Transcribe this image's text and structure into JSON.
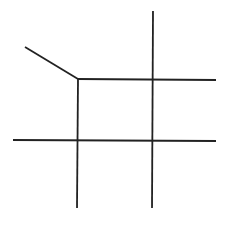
{
  "diagram": {
    "stroke_color": "#222222",
    "stroke_width": 1.8,
    "background": "#ffffff",
    "lines": [
      {
        "id": "diagonal-segment",
        "x1": 25,
        "y1": 47,
        "x2": 78,
        "y2": 79
      },
      {
        "id": "top-horizontal",
        "x1": 78,
        "y1": 79,
        "x2": 216,
        "y2": 80
      },
      {
        "id": "bottom-horizontal",
        "x1": 13,
        "y1": 140,
        "x2": 216,
        "y2": 141
      },
      {
        "id": "left-vertical",
        "x1": 78,
        "y1": 79,
        "x2": 77,
        "y2": 208
      },
      {
        "id": "right-vertical",
        "x1": 153,
        "y1": 11,
        "x2": 152,
        "y2": 208
      }
    ]
  }
}
